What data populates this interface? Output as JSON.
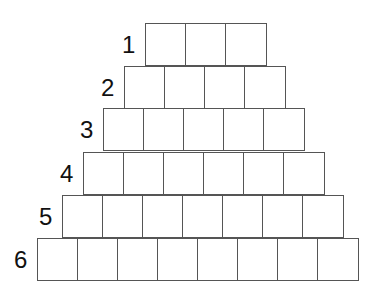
{
  "diagram": {
    "title": "",
    "rows": [
      {
        "label": "1",
        "count": 3,
        "left": 145,
        "top": 23
      },
      {
        "label": "2",
        "count": 4,
        "left": 124,
        "top": 66
      },
      {
        "label": "3",
        "count": 5,
        "left": 103,
        "top": 108
      },
      {
        "label": "4",
        "count": 6,
        "left": 83,
        "top": 152
      },
      {
        "label": "5",
        "count": 7,
        "left": 62,
        "top": 195
      },
      {
        "label": "6",
        "count": 8,
        "left": 37,
        "top": 238
      }
    ],
    "colors": {
      "line": "#555555",
      "text": "#111111",
      "background": "#ffffff"
    }
  }
}
